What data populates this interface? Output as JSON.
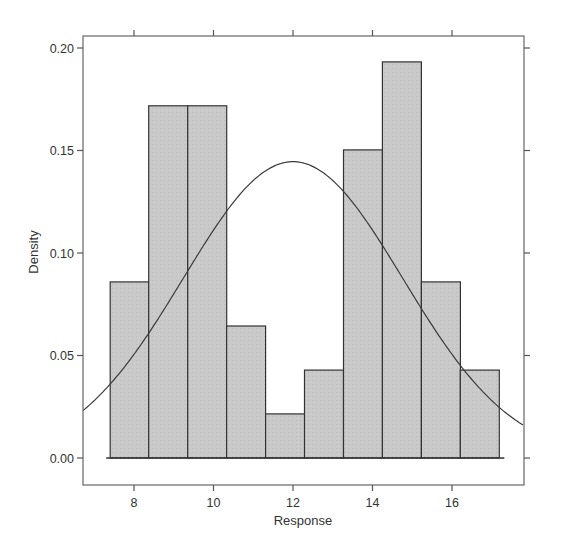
{
  "chart_data": {
    "type": "bar",
    "subtype": "histogram_with_density_curve",
    "title": "",
    "xlabel": "Response",
    "ylabel": "Density",
    "xlim": [
      6.72,
      17.8
    ],
    "ylim": [
      0.0,
      0.206
    ],
    "x_ticks": [
      8,
      10,
      12,
      14,
      16
    ],
    "x_tick_labels": [
      "8",
      "10",
      "12",
      "14",
      "16"
    ],
    "y_ticks": [
      0.0,
      0.05,
      0.1,
      0.15,
      0.2
    ],
    "y_tick_labels": [
      "0.00",
      "0.05",
      "0.10",
      "0.15",
      "0.20"
    ],
    "grid": false,
    "legend": null,
    "bins": [
      {
        "left": 7.4,
        "right": 8.37,
        "density": 0.0859
      },
      {
        "left": 8.37,
        "right": 9.35,
        "density": 0.1718
      },
      {
        "left": 9.35,
        "right": 10.33,
        "density": 0.1718
      },
      {
        "left": 10.33,
        "right": 11.31,
        "density": 0.0644
      },
      {
        "left": 11.31,
        "right": 12.29,
        "density": 0.0215
      },
      {
        "left": 12.29,
        "right": 13.27,
        "density": 0.0429
      },
      {
        "left": 13.27,
        "right": 14.25,
        "density": 0.1503
      },
      {
        "left": 14.25,
        "right": 15.23,
        "density": 0.1932
      },
      {
        "left": 15.23,
        "right": 16.21,
        "density": 0.0859
      },
      {
        "left": 16.21,
        "right": 17.19,
        "density": 0.0429
      }
    ],
    "categories": [
      "7.4-8.4",
      "8.4-9.3",
      "9.3-10.3",
      "10.3-11.3",
      "11.3-12.3",
      "12.3-13.3",
      "13.3-14.3",
      "14.3-15.2",
      "15.2-16.2",
      "16.2-17.2"
    ],
    "values": [
      0.0859,
      0.1718,
      0.1718,
      0.0644,
      0.0215,
      0.0429,
      0.1503,
      0.1932,
      0.0859,
      0.0429
    ],
    "overlay_curve": {
      "type": "normal_density",
      "mean": 12.0,
      "sd": 2.76
    },
    "colors": {
      "bar_fill": "#c8c8c8",
      "bar_edge": "#333333",
      "curve": "#333333",
      "frame": "#555555"
    }
  }
}
